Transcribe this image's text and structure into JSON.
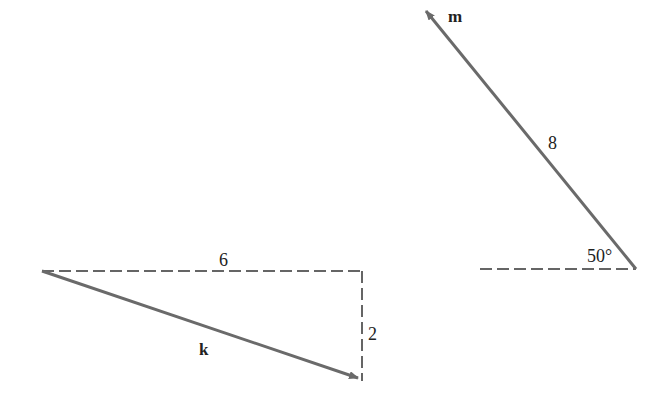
{
  "diagram": {
    "colors": {
      "vector": "#6a6a6a",
      "dashed": "#333333",
      "text": "#222222",
      "background": "#ffffff"
    },
    "vector_k": {
      "label": "k",
      "start": [
        42,
        271
      ],
      "end": [
        360,
        379
      ],
      "horizontal_component_label": "6",
      "vertical_component_label": "2"
    },
    "vector_m": {
      "label": "m",
      "start": [
        636,
        269
      ],
      "end": [
        424,
        9
      ],
      "magnitude_label": "8",
      "angle_label": "50°"
    }
  }
}
